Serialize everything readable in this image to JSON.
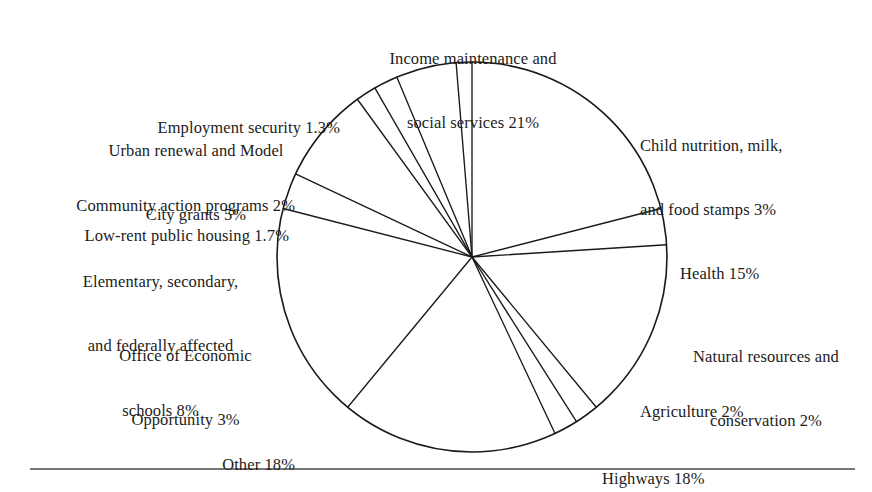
{
  "figure": {
    "background_color": "#ffffff",
    "ink_color": "#1c1c1c",
    "rule_color": "#4a4a4a"
  },
  "chart_data": {
    "type": "pie",
    "title": "",
    "subtitle": "",
    "xlabel": "",
    "ylabel": "",
    "grid": false,
    "legend_position": "callout-labels",
    "units": "percent",
    "start_angle_deg": 0,
    "direction": "clockwise",
    "center": {
      "x": 472,
      "y": 257
    },
    "radius": 195,
    "categories": [
      "Income maintenance and social services",
      "Child nutrition, milk, and food stamps",
      "Health",
      "Natural resources and conservation",
      "Agriculture",
      "Highways",
      "Other",
      "Office of Economic Opportunity",
      "Elementary, secondary, and federally affected schools",
      "Low-rent public housing",
      "Community action programs",
      "Urban renewal and Model City grants",
      "Employment security"
    ],
    "values": [
      21,
      3,
      15,
      2,
      2,
      18,
      18,
      3,
      8,
      1.7,
      2,
      5,
      1.3
    ],
    "value_labels": [
      "21%",
      "3%",
      "15%",
      "2%",
      "2%",
      "18%",
      "18%",
      "3%",
      "8%",
      "1.7%",
      "2%",
      "5%",
      "1.3%"
    ],
    "slices": [
      {
        "label": "Income maintenance and social services",
        "value": 21,
        "value_label": "21%"
      },
      {
        "label": "Child nutrition, milk, and food stamps",
        "value": 3,
        "value_label": "3%"
      },
      {
        "label": "Health",
        "value": 15,
        "value_label": "15%"
      },
      {
        "label": "Natural resources and conservation",
        "value": 2,
        "value_label": "2%"
      },
      {
        "label": "Agriculture",
        "value": 2,
        "value_label": "2%"
      },
      {
        "label": "Highways",
        "value": 18,
        "value_label": "18%"
      },
      {
        "label": "Other",
        "value": 18,
        "value_label": "18%"
      },
      {
        "label": "Office of Economic Opportunity",
        "value": 3,
        "value_label": "3%"
      },
      {
        "label": "Elementary, secondary, and federally affected schools",
        "value": 8,
        "value_label": "8%"
      },
      {
        "label": "Low-rent public housing",
        "value": 1.7,
        "value_label": "1.7%"
      },
      {
        "label": "Community action programs",
        "value": 2,
        "value_label": "2%"
      },
      {
        "label": "Urban renewal and Model City grants",
        "value": 5,
        "value_label": "5%"
      },
      {
        "label": "Employment security",
        "value": 1.3,
        "value_label": "1.3%"
      }
    ]
  },
  "labels": {
    "income_maintenance": {
      "line1": "Income maintenance and",
      "line2": "social services 21%"
    },
    "child_nutrition": {
      "line1": "Child nutrition, milk,",
      "line2": "and food stamps 3%"
    },
    "health": {
      "line1": "Health 15%"
    },
    "natural_resources": {
      "line1": "Natural resources and",
      "line2": "conservation 2%"
    },
    "agriculture": {
      "line1": "Agriculture 2%"
    },
    "highways": {
      "line1": "Highways 18%"
    },
    "other": {
      "line1": "Other 18%"
    },
    "office_economic_opportunity": {
      "line1": "Office of Economic",
      "line2": "Opportunity 3%"
    },
    "schools": {
      "line1": "Elementary, secondary,",
      "line2": "and federally affected",
      "line3": "schools 8%"
    },
    "low_rent_housing": {
      "line1": "Low-rent public housing 1.7%"
    },
    "community_action": {
      "line1": "Community action programs 2%"
    },
    "urban_renewal": {
      "line1": "Urban renewal and Model",
      "line2": "City grants 5%"
    },
    "employment_security": {
      "line1": "Employment security 1.3%"
    }
  }
}
